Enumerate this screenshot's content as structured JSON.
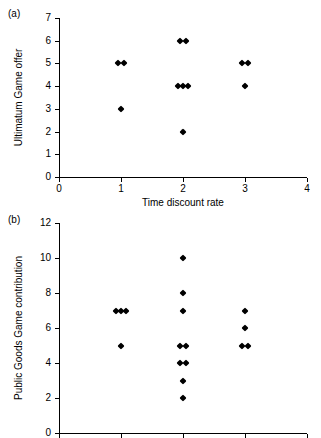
{
  "figure": {
    "background_color": "#ffffff",
    "marker_color": "#000000",
    "axis_color": "#000000"
  },
  "panels": {
    "a": {
      "label": "(a)"
    },
    "b": {
      "label": "(b)"
    }
  },
  "chart_data": [
    {
      "type": "scatter",
      "panel": "(a)",
      "title": "",
      "xlabel": "Time discount rate",
      "ylabel": "Ultimatum Game offer",
      "xlim": [
        0,
        4
      ],
      "ylim": [
        0,
        7
      ],
      "xticks": [
        0,
        1,
        2,
        3,
        4
      ],
      "xticklabels": [
        "0",
        "1",
        "2",
        "3",
        "4"
      ],
      "yticks": [
        0,
        1,
        2,
        3,
        4,
        5,
        6,
        7
      ],
      "yticklabels": [
        "0",
        "1",
        "2",
        "3",
        "4",
        "5",
        "6",
        "7"
      ],
      "grid": false,
      "legend": null,
      "marker": "filled-diamond",
      "points": [
        {
          "x": 1,
          "y": 5,
          "count": 2,
          "jitter": [
            -0.055,
            0.055
          ]
        },
        {
          "x": 1,
          "y": 3,
          "count": 1,
          "jitter": [
            0.0
          ]
        },
        {
          "x": 2,
          "y": 6,
          "count": 2,
          "jitter": [
            -0.05,
            0.05
          ]
        },
        {
          "x": 2,
          "y": 4,
          "count": 3,
          "jitter": [
            -0.085,
            0.0,
            0.085
          ]
        },
        {
          "x": 2,
          "y": 2,
          "count": 1,
          "jitter": [
            0.0
          ]
        },
        {
          "x": 3,
          "y": 5,
          "count": 2,
          "jitter": [
            -0.05,
            0.05
          ]
        },
        {
          "x": 3,
          "y": 4,
          "count": 1,
          "jitter": [
            0.0
          ]
        }
      ]
    },
    {
      "type": "scatter",
      "panel": "(b)",
      "title": "",
      "xlabel": "Time discount rate",
      "ylabel": "Public Goods Game contribution",
      "xlim": [
        0,
        4
      ],
      "ylim": [
        0,
        12
      ],
      "xticks": [
        0,
        1,
        2,
        3,
        4
      ],
      "xticklabels": [
        "0",
        "1",
        "2",
        "3",
        "4"
      ],
      "yticks": [
        0,
        2,
        4,
        6,
        8,
        10,
        12
      ],
      "yticklabels": [
        "0",
        "2",
        "4",
        "6",
        "8",
        "10",
        "12"
      ],
      "grid": false,
      "legend": null,
      "marker": "filled-diamond",
      "points": [
        {
          "x": 1,
          "y": 7,
          "count": 3,
          "jitter": [
            -0.085,
            0.0,
            0.085
          ]
        },
        {
          "x": 1,
          "y": 5,
          "count": 1,
          "jitter": [
            0.0
          ]
        },
        {
          "x": 2,
          "y": 10,
          "count": 1,
          "jitter": [
            0.0
          ]
        },
        {
          "x": 2,
          "y": 8,
          "count": 1,
          "jitter": [
            0.0
          ]
        },
        {
          "x": 2,
          "y": 7,
          "count": 1,
          "jitter": [
            0.0
          ]
        },
        {
          "x": 2,
          "y": 5,
          "count": 2,
          "jitter": [
            -0.05,
            0.05
          ]
        },
        {
          "x": 2,
          "y": 4,
          "count": 2,
          "jitter": [
            -0.05,
            0.05
          ]
        },
        {
          "x": 2,
          "y": 3,
          "count": 1,
          "jitter": [
            0.0
          ]
        },
        {
          "x": 2,
          "y": 2,
          "count": 1,
          "jitter": [
            0.0
          ]
        },
        {
          "x": 3,
          "y": 7,
          "count": 1,
          "jitter": [
            0.0
          ]
        },
        {
          "x": 3,
          "y": 6,
          "count": 1,
          "jitter": [
            0.0
          ]
        },
        {
          "x": 3,
          "y": 5,
          "count": 2,
          "jitter": [
            -0.05,
            0.05
          ]
        }
      ]
    }
  ]
}
